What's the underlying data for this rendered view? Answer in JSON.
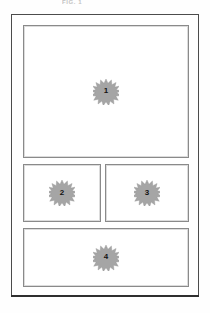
{
  "header": {
    "clipped_text": "FIG. 1"
  },
  "sheet": {
    "name": "drawing-sheet",
    "border_color": "#4c4c4c"
  },
  "colors": {
    "sheet_border": "#4c4c4c",
    "panel_border": "#8a8a8a",
    "burst_fill": "#9e9e9e",
    "burst_edge": "#8c8c8c",
    "label_text": "#121212",
    "page_background": "#fefefe"
  },
  "diagram": {
    "type": "panel-layout",
    "panel_count": 4,
    "row_layout": [
      "full",
      "split",
      "full"
    ],
    "panels": [
      {
        "id": "panel-1",
        "label": "1",
        "row": 1,
        "span": "full",
        "marker": "starburst"
      },
      {
        "id": "panel-2",
        "label": "2",
        "row": 2,
        "span": "left-half",
        "marker": "starburst"
      },
      {
        "id": "panel-3",
        "label": "3",
        "row": 2,
        "span": "right-half",
        "marker": "starburst"
      },
      {
        "id": "panel-4",
        "label": "4",
        "row": 3,
        "span": "full",
        "marker": "starburst"
      }
    ]
  }
}
